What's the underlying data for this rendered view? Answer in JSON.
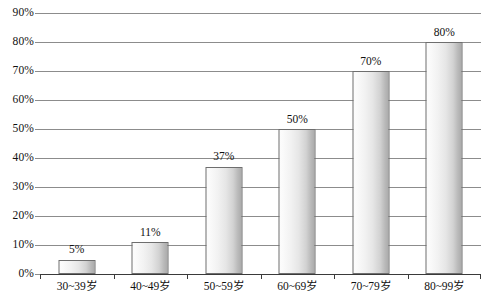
{
  "chart_data": {
    "type": "bar",
    "title": "",
    "subtitle": "",
    "xlabel": "",
    "ylabel": "",
    "categories": [
      "30~39岁",
      "40~49岁",
      "50~59岁",
      "60~69岁",
      "70~79岁",
      "80~99岁"
    ],
    "values": [
      5,
      11,
      37,
      50,
      70,
      80
    ],
    "value_labels": [
      "5%",
      "11%",
      "37%",
      "50%",
      "70%",
      "80%"
    ],
    "ylim": [
      0,
      90
    ],
    "ytick_values": [
      0,
      10,
      20,
      30,
      40,
      50,
      60,
      70,
      80,
      90
    ],
    "ytick_labels": [
      "0%",
      "10%",
      "20%",
      "30%",
      "40%",
      "50%",
      "60%",
      "70%",
      "80%",
      "90%"
    ],
    "grid": "horizontal",
    "legend": "none",
    "annotations": [],
    "colors": {
      "bar_fill_light": "#fcfcfc",
      "bar_fill_dark": "#ababab",
      "bar_border": "#6e6e6e",
      "gridline": "#8c8c8c",
      "axis": "#3a3a3a",
      "text": "#111111",
      "background": "#ffffff"
    }
  }
}
